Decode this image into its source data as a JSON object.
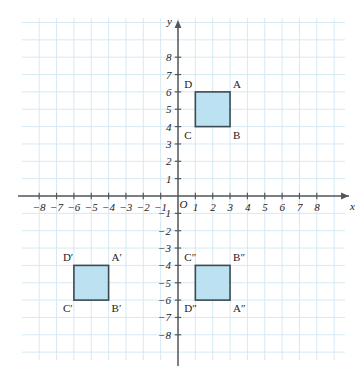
{
  "chart_data": {
    "type": "scatter",
    "title": "",
    "xlabel": "x",
    "ylabel": "y",
    "xlim": [
      -9,
      9
    ],
    "ylim": [
      -9,
      9
    ],
    "grid": true,
    "grid_spacing": 1,
    "legend": "none",
    "origin_label": "O",
    "x_ticks": [
      -8,
      -7,
      -6,
      -5,
      -4,
      -3,
      -2,
      -1,
      1,
      2,
      3,
      4,
      5,
      6,
      7,
      8
    ],
    "y_ticks": [
      8,
      7,
      6,
      5,
      4,
      3,
      2,
      1,
      -1,
      -2,
      -3,
      -4,
      -5,
      -6,
      -7,
      -8
    ],
    "x_tick_labels": [
      "−8",
      "−7",
      "−6",
      "−5",
      "−4",
      "−3",
      "−2",
      "−1",
      "1",
      "2",
      "3",
      "4",
      "5",
      "6",
      "7",
      "8"
    ],
    "y_tick_labels": [
      "8",
      "7",
      "6",
      "5",
      "4",
      "3",
      "2",
      "1",
      "−1",
      "−2",
      "−3",
      "−4",
      "−5",
      "−6",
      "−7",
      "−8"
    ],
    "shapes": [
      {
        "name": "square-abcd",
        "fill": "#b8dff0",
        "stroke": "#3a4a55",
        "x_range": [
          1,
          3
        ],
        "y_range": [
          4,
          6
        ],
        "vertices": [
          {
            "label": "A",
            "x": 3,
            "y": 6,
            "anchor": "top-right"
          },
          {
            "label": "B",
            "x": 3,
            "y": 4,
            "anchor": "bottom-right"
          },
          {
            "label": "C",
            "x": 1,
            "y": 4,
            "anchor": "bottom-left"
          },
          {
            "label": "D",
            "x": 1,
            "y": 6,
            "anchor": "top-left"
          }
        ]
      },
      {
        "name": "square-abcd-prime",
        "fill": "#b8dff0",
        "stroke": "#3a4a55",
        "x_range": [
          -6,
          -4
        ],
        "y_range": [
          -6,
          -4
        ],
        "vertices": [
          {
            "label": "A′",
            "x": -4,
            "y": -4,
            "anchor": "top-right"
          },
          {
            "label": "B′",
            "x": -4,
            "y": -6,
            "anchor": "bottom-right"
          },
          {
            "label": "C′",
            "x": -6,
            "y": -6,
            "anchor": "bottom-left"
          },
          {
            "label": "D′",
            "x": -6,
            "y": -4,
            "anchor": "top-left"
          }
        ]
      },
      {
        "name": "square-abcd-double-prime",
        "fill": "#b8dff0",
        "stroke": "#3a4a55",
        "x_range": [
          1,
          3
        ],
        "y_range": [
          -6,
          -4
        ],
        "vertices": [
          {
            "label": "A″",
            "x": 3,
            "y": -6,
            "anchor": "bottom-right"
          },
          {
            "label": "B″",
            "x": 3,
            "y": -4,
            "anchor": "top-right"
          },
          {
            "label": "C″",
            "x": 1,
            "y": -4,
            "anchor": "top-left"
          },
          {
            "label": "D″",
            "x": 1,
            "y": -6,
            "anchor": "bottom-left"
          }
        ]
      }
    ]
  },
  "colors": {
    "grid": "#d5e9f3",
    "axis": "#55585a",
    "shape_fill": "#b8dff0",
    "shape_stroke": "#3a4a55",
    "text": "#1c1c1c",
    "background": "#ffffff"
  },
  "labels": {
    "x_axis_name": "x",
    "y_axis_name": "y",
    "origin": "O"
  }
}
